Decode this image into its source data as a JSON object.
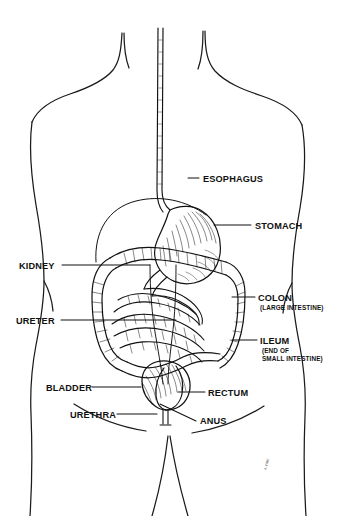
{
  "figure": {
    "style": "black-and-white line engraving",
    "background_color": "#ffffff",
    "ink_color": "#111111",
    "signature": "a. rose"
  },
  "labels": [
    {
      "id": "esophagus",
      "text": "ESOPHAGUS",
      "sublines": [],
      "side": "right",
      "text_x": 203,
      "text_y": 182,
      "leader": "M188,178 L199,178"
    },
    {
      "id": "stomach",
      "text": "STOMACH",
      "sublines": [],
      "side": "right",
      "text_x": 255,
      "text_y": 229,
      "leader": "M214,225 L251,225"
    },
    {
      "id": "kidney",
      "text": "KIDNEY",
      "sublines": [],
      "side": "left",
      "text_x": 19,
      "text_y": 269,
      "leader": "M62,265 L150,265"
    },
    {
      "id": "colon",
      "text": "COLON",
      "sublines": [
        "(LARGE INTESTINE)"
      ],
      "side": "right",
      "text_x": 258,
      "text_y": 301,
      "leader": "M232,297 L255,297"
    },
    {
      "id": "ureter",
      "text": "URETER",
      "sublines": [],
      "side": "left",
      "text_x": 16,
      "text_y": 324,
      "leader": "M61,320 L176,320"
    },
    {
      "id": "ileum",
      "text": "ILEUM",
      "sublines": [
        "(END OF",
        "SMALL INTESTINE)"
      ],
      "side": "right",
      "text_x": 260,
      "text_y": 344,
      "leader": "M232,340 L257,340"
    },
    {
      "id": "bladder",
      "text": "BLADDER",
      "sublines": [],
      "side": "left",
      "text_x": 46,
      "text_y": 391,
      "leader": "M92,387 L141,387"
    },
    {
      "id": "rectum",
      "text": "RECTUM",
      "sublines": [],
      "side": "right",
      "text_x": 208,
      "text_y": 396,
      "leader": "M178,392 L205,392"
    },
    {
      "id": "urethra",
      "text": "URETHRA",
      "sublines": [],
      "side": "left",
      "text_x": 70,
      "text_y": 418,
      "leader": "M117,414 L157,414"
    },
    {
      "id": "anus",
      "text": "ANUS",
      "sublines": [],
      "side": "right",
      "text_x": 200,
      "text_y": 424,
      "leader": "M160,404 L196,421"
    }
  ]
}
